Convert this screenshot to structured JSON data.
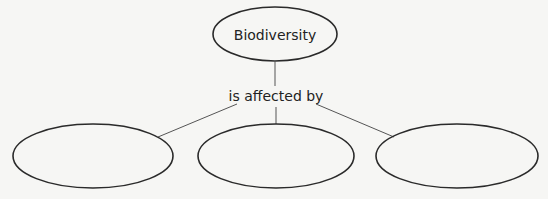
{
  "diagram": {
    "type": "concept-map",
    "root": {
      "label": "Biodiversity"
    },
    "relation": {
      "label": "is affected by"
    },
    "children": [
      {
        "label": ""
      },
      {
        "label": ""
      },
      {
        "label": ""
      }
    ]
  },
  "colors": {
    "background": "#f6f6f4",
    "stroke": "#2a2a2a",
    "connector": "#555555",
    "text": "#222222"
  }
}
